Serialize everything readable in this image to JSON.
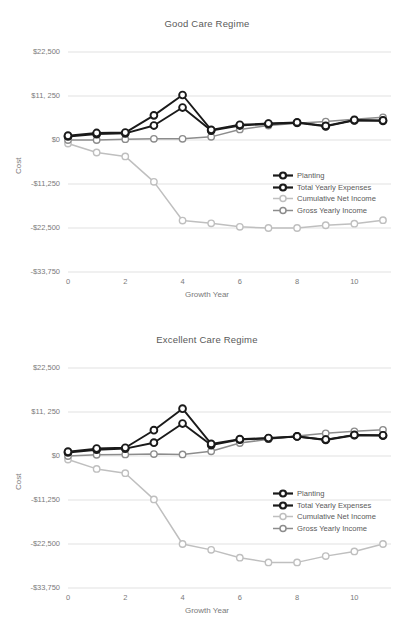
{
  "figure": {
    "axis_x_label": "Growth Year",
    "axis_y_label": "Cost",
    "ytick_labels": [
      "$22,500",
      "$11, 250",
      "$0",
      "-$11,250",
      "-$22,500",
      "-$33,750"
    ],
    "xtick_labels": [
      "0",
      "2",
      "4",
      "6",
      "8",
      "10"
    ],
    "colors": {
      "planting": "#1a1a1a",
      "total_yearly_expenses": "#1a1a1a",
      "cumulative_net_income": "#bfbfbf",
      "gross_yearly_income": "#8c8c8c",
      "gridline": "#d9d9d9",
      "text": "#595959"
    }
  },
  "chart_data": [
    {
      "type": "line",
      "title": "Good Care Regime",
      "xlabel": "Growth Year",
      "ylabel": "Cost",
      "x": [
        0,
        1,
        2,
        3,
        4,
        5,
        6,
        7,
        8,
        9,
        10,
        11
      ],
      "xlim": [
        0,
        11
      ],
      "ylim": [
        -33750,
        22500
      ],
      "yticks": [
        22500,
        11250,
        0,
        -11250,
        -22500,
        -33750
      ],
      "xticks": [
        0,
        2,
        4,
        6,
        8,
        10
      ],
      "grid": true,
      "legend_position": "center-right",
      "series": [
        {
          "name": "Planting",
          "color": "#1a1a1a",
          "values": [
            1100,
            1800,
            1900,
            6300,
            11500,
            2600,
            3900,
            4200,
            4500,
            3600,
            5100,
            5000
          ]
        },
        {
          "name": "Total Yearly Expenses",
          "color": "#1a1a1a",
          "values": [
            900,
            1500,
            1700,
            3700,
            8300,
            2400,
            3700,
            4100,
            4400,
            3500,
            5000,
            4900
          ]
        },
        {
          "name": "Cumulative Net Income",
          "color": "#bfbfbf",
          "values": [
            -900,
            -3200,
            -4200,
            -10700,
            -20600,
            -21300,
            -22200,
            -22500,
            -22500,
            -21800,
            -21400,
            -20500
          ]
        },
        {
          "name": "Gross Yearly Income",
          "color": "#8c8c8c",
          "values": [
            0,
            0,
            200,
            300,
            300,
            800,
            2700,
            3700,
            4300,
            4700,
            5300,
            5800
          ]
        }
      ]
    },
    {
      "type": "line",
      "title": "Excellent Care Regime",
      "xlabel": "Growth Year",
      "ylabel": "Cost",
      "x": [
        0,
        1,
        2,
        3,
        4,
        5,
        6,
        7,
        8,
        9,
        10,
        11
      ],
      "xlim": [
        0,
        11
      ],
      "ylim": [
        -33750,
        22500
      ],
      "yticks": [
        22500,
        11250,
        0,
        -11250,
        -22500,
        -33750
      ],
      "xticks": [
        0,
        2,
        4,
        6,
        8,
        10
      ],
      "grid": true,
      "legend_position": "center-right",
      "series": [
        {
          "name": "Planting",
          "color": "#1a1a1a",
          "values": [
            1100,
            1900,
            2100,
            6600,
            12100,
            3100,
            4300,
            4600,
            5000,
            4200,
            5400,
            5300
          ]
        },
        {
          "name": "Total Yearly Expenses",
          "color": "#1a1a1a",
          "values": [
            900,
            1600,
            1900,
            3400,
            8300,
            2800,
            4200,
            4500,
            5000,
            4100,
            5300,
            5200
          ]
        },
        {
          "name": "Cumulative Net Income",
          "color": "#bfbfbf",
          "values": [
            -900,
            -3300,
            -4400,
            -11100,
            -22500,
            -24000,
            -26000,
            -27200,
            -27200,
            -25600,
            -24400,
            -22500
          ]
        },
        {
          "name": "Gross Yearly Income",
          "color": "#8c8c8c",
          "values": [
            0,
            300,
            400,
            500,
            400,
            1200,
            3300,
            4300,
            5100,
            5800,
            6300,
            6700
          ]
        }
      ]
    }
  ],
  "legend": {
    "items": [
      {
        "label": "Planting",
        "style": "dark"
      },
      {
        "label": "Total Yearly Expenses",
        "style": "dark"
      },
      {
        "label": "Cumulative Net Income",
        "style": "light"
      },
      {
        "label": "Gross Yearly Income",
        "style": "mid"
      }
    ]
  }
}
